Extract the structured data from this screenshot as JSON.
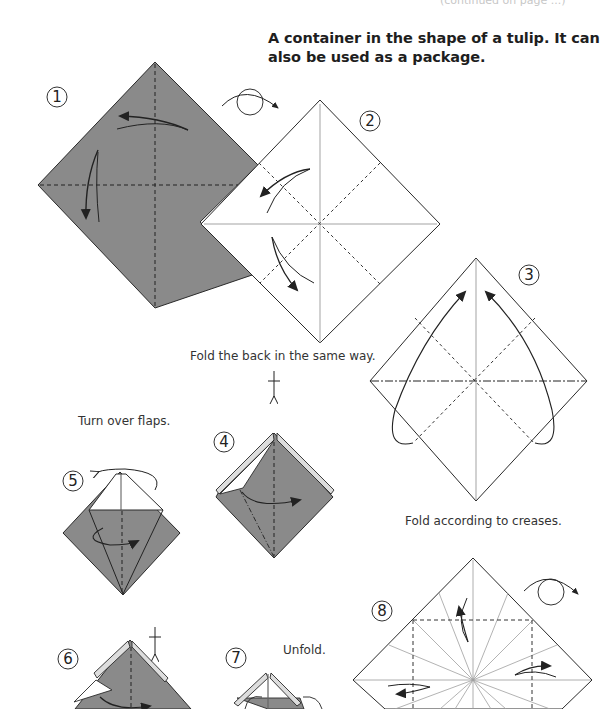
{
  "header": {
    "cut_off_text": "(continued on page ...)",
    "title": "A container in the shape of a tulip. It can also be used as a package."
  },
  "colors": {
    "paper_colored": "#8a8a8a",
    "paper_white": "#ffffff",
    "line": "#2a2a2a",
    "crease": "#9a9a9a"
  },
  "steps": [
    {
      "number": "1",
      "instruction": "",
      "icon": "valley-fold-arrows"
    },
    {
      "number": "2",
      "instruction": "",
      "icon": "valley-fold-arrows"
    },
    {
      "number": "3",
      "instruction": "Fold according to creases.",
      "icon": "collapse-arrows"
    },
    {
      "number": "4",
      "instruction": "Fold the back in the same way.",
      "icon": "fold-arrow"
    },
    {
      "number": "5",
      "instruction": "Turn over flaps.",
      "icon": "turn-over-arrow"
    },
    {
      "number": "6",
      "instruction": "",
      "icon": "fold-arrow"
    },
    {
      "number": "7",
      "instruction": "Unfold.",
      "icon": "unfold-arrow"
    },
    {
      "number": "8",
      "instruction": "",
      "icon": "crease-arrows"
    }
  ],
  "symbols": {
    "turn_over_1": "turn-over-icon",
    "turn_over_2": "turn-over-icon"
  }
}
